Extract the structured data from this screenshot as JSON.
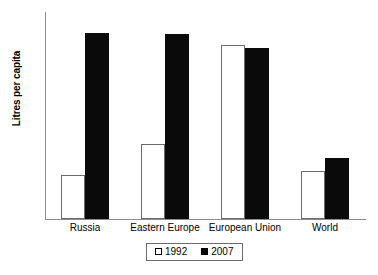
{
  "chart_data": {
    "type": "bar",
    "title": "",
    "subtitle": "",
    "xlabel": "",
    "ylabel": "Litres per capita",
    "ylim": [
      0,
      90
    ],
    "ytick_step": 10,
    "yticks": [
      90,
      80,
      70,
      60,
      50,
      40,
      30,
      20,
      10,
      0
    ],
    "grid": false,
    "legend_position": "bottom-center",
    "categories": [
      "Russia",
      "Eastern Europe",
      "European Union",
      "World"
    ],
    "series": [
      {
        "name": "1992",
        "values": [
          19,
          32.5,
          75.5,
          21
        ],
        "style": "open",
        "color": "#ffffff",
        "edge_color": "#6b6b6b"
      },
      {
        "name": "2007",
        "values": [
          81,
          80.5,
          74.5,
          26.5
        ],
        "style": "filled",
        "color": "#000000",
        "edge_color": "#000000"
      }
    ]
  },
  "legend": {
    "items": [
      {
        "label": "1992",
        "swatch": "open-square-icon"
      },
      {
        "label": "2007",
        "swatch": "filled-square-icon"
      }
    ]
  }
}
